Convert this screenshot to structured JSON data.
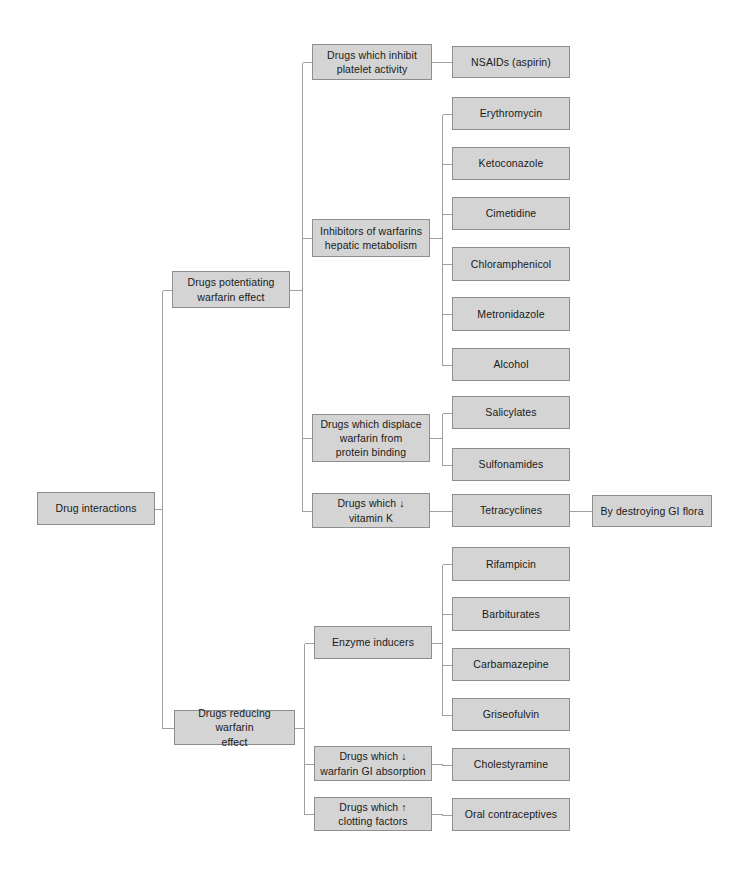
{
  "diagram": {
    "title": "Drug interactions",
    "root": {
      "label": "Drug interactions",
      "x": 37,
      "y": 492,
      "w": 118,
      "h": 33
    },
    "branches": [
      {
        "label": "Drugs potentiating\nwarfarin effect",
        "x": 172,
        "y": 271,
        "w": 118,
        "h": 37,
        "children": [
          {
            "label": "Drugs which inhibit\nplatelet activity",
            "x": 312,
            "y": 44,
            "w": 120,
            "h": 36,
            "children": [
              {
                "label": "NSAIDs (aspirin)",
                "x": 452,
                "y": 46,
                "w": 118,
                "h": 32,
                "children": []
              }
            ]
          },
          {
            "label": "Inhibitors of warfarins\nhepatic metabolism",
            "x": 312,
            "y": 219,
            "w": 118,
            "h": 38,
            "children": [
              {
                "label": "Erythromycin",
                "x": 452,
                "y": 97,
                "w": 118,
                "h": 33,
                "children": []
              },
              {
                "label": "Ketoconazole",
                "x": 452,
                "y": 147,
                "w": 118,
                "h": 33,
                "children": []
              },
              {
                "label": "Cimetidine",
                "x": 452,
                "y": 197,
                "w": 118,
                "h": 33,
                "children": []
              },
              {
                "label": "Chloramphenicol",
                "x": 452,
                "y": 247,
                "w": 118,
                "h": 34,
                "children": []
              },
              {
                "label": "Metronidazole",
                "x": 452,
                "y": 297,
                "w": 118,
                "h": 34,
                "children": []
              },
              {
                "label": "Alcohol",
                "x": 452,
                "y": 348,
                "w": 118,
                "h": 33,
                "children": []
              }
            ]
          },
          {
            "label": "Drugs which displace\nwarfarin from\nprotein  binding",
            "x": 312,
            "y": 414,
            "w": 118,
            "h": 48,
            "children": [
              {
                "label": "Salicylates",
                "x": 452,
                "y": 396,
                "w": 118,
                "h": 33,
                "children": []
              },
              {
                "label": "Sulfonamides",
                "x": 452,
                "y": 448,
                "w": 118,
                "h": 33,
                "children": []
              }
            ]
          },
          {
            "label": "Drugs which ↓\nvitamin K",
            "x": 312,
            "y": 493,
            "w": 118,
            "h": 35,
            "children": [
              {
                "label": "Tetracyclines",
                "x": 452,
                "y": 494,
                "w": 118,
                "h": 33,
                "children": [
                  {
                    "label": "By destroying GI flora",
                    "x": 592,
                    "y": 495,
                    "w": 120,
                    "h": 32,
                    "children": []
                  }
                ]
              }
            ]
          }
        ]
      },
      {
        "label": "Drugs reducing warfarin\neffect",
        "x": 174,
        "y": 710,
        "w": 121,
        "h": 35,
        "children": [
          {
            "label": "Enzyme inducers",
            "x": 314,
            "y": 626,
            "w": 118,
            "h": 33,
            "children": [
              {
                "label": "Rifampicin",
                "x": 452,
                "y": 547,
                "w": 118,
                "h": 34,
                "children": []
              },
              {
                "label": "Barbiturates",
                "x": 452,
                "y": 597,
                "w": 118,
                "h": 34,
                "children": []
              },
              {
                "label": "Carbamazepine",
                "x": 452,
                "y": 648,
                "w": 118,
                "h": 33,
                "children": []
              },
              {
                "label": "Griseofulvin",
                "x": 452,
                "y": 698,
                "w": 118,
                "h": 33,
                "children": []
              }
            ]
          },
          {
            "label": "Drugs which ↓\nwarfarin GI absorption",
            "x": 314,
            "y": 746,
            "w": 118,
            "h": 35,
            "children": [
              {
                "label": "Cholestyramine",
                "x": 452,
                "y": 748,
                "w": 118,
                "h": 33,
                "children": []
              }
            ]
          },
          {
            "label": "Drugs which ↑\nclotting factors",
            "x": 314,
            "y": 797,
            "w": 118,
            "h": 34,
            "children": [
              {
                "label": "Oral contraceptives",
                "x": 452,
                "y": 798,
                "w": 118,
                "h": 33,
                "children": []
              }
            ]
          }
        ]
      }
    ],
    "colors": {
      "box_fill": "#d4d4d4",
      "box_border": "#8e8e8e",
      "connector": "#a0a0a0",
      "text": "#1a1a1a",
      "background": "#ffffff"
    }
  }
}
